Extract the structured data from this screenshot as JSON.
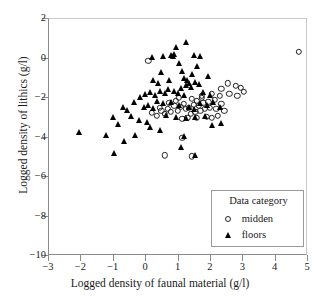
{
  "chart_data": {
    "type": "scatter",
    "title": "",
    "xlabel": "Logged density of faunal material (g/l)",
    "ylabel": "Logged density of lithics (g/l)",
    "xlim": [
      -3,
      5
    ],
    "ylim": [
      -10,
      2
    ],
    "xticks": [
      -3,
      -2,
      -1,
      0,
      1,
      2,
      3,
      4,
      5
    ],
    "yticks": [
      2,
      0,
      -2,
      -4,
      -6,
      -8,
      -10
    ],
    "xticklabels": [
      "−3",
      "−2",
      "−1",
      "0",
      "1",
      "2",
      "3",
      "4",
      "5"
    ],
    "yticklabels": [
      "2",
      "0",
      "−2",
      "−4",
      "−6",
      "−8",
      "−10"
    ],
    "grid": false,
    "legend_position": "lower right",
    "legend_title": "Data category",
    "series": [
      {
        "name": "midden",
        "marker": "open-circle",
        "color": "#222222",
        "points": [
          [
            4.75,
            0.3
          ],
          [
            2.55,
            -1.3
          ],
          [
            2.8,
            -1.45
          ],
          [
            2.95,
            -1.55
          ],
          [
            3.05,
            -1.75
          ],
          [
            2.35,
            -1.6
          ],
          [
            2.6,
            -1.85
          ],
          [
            2.85,
            -1.95
          ],
          [
            2.3,
            -1.95
          ],
          [
            2.05,
            -1.85
          ],
          [
            2.15,
            -2.15
          ],
          [
            1.95,
            -2.25
          ],
          [
            2.35,
            -2.35
          ],
          [
            1.75,
            -2.05
          ],
          [
            1.8,
            -2.3
          ],
          [
            1.6,
            -2.2
          ],
          [
            1.65,
            -2.45
          ],
          [
            1.45,
            -2.1
          ],
          [
            1.5,
            -2.4
          ],
          [
            1.35,
            -2.55
          ],
          [
            1.2,
            -2.35
          ],
          [
            1.25,
            -2.6
          ],
          [
            1.1,
            -2.5
          ],
          [
            1.0,
            -2.7
          ],
          [
            0.9,
            -2.45
          ],
          [
            0.8,
            -2.75
          ],
          [
            0.7,
            -2.6
          ],
          [
            0.6,
            -2.85
          ],
          [
            0.5,
            -2.7
          ],
          [
            0.35,
            -2.95
          ],
          [
            0.2,
            -2.8
          ],
          [
            1.4,
            -2.85
          ],
          [
            1.55,
            -2.75
          ],
          [
            1.7,
            -2.7
          ],
          [
            1.85,
            -2.6
          ],
          [
            2.0,
            -2.55
          ],
          [
            2.2,
            -2.6
          ],
          [
            2.45,
            -2.7
          ],
          [
            1.3,
            -3.05
          ],
          [
            1.15,
            -3.1
          ],
          [
            1.6,
            -3.05
          ],
          [
            1.9,
            -3.0
          ],
          [
            0.95,
            -2.2
          ],
          [
            1.05,
            -2.05
          ],
          [
            0.75,
            -2.3
          ],
          [
            0.1,
            -0.15
          ],
          [
            1.15,
            -4.05
          ],
          [
            1.45,
            -5.0
          ],
          [
            0.6,
            -4.95
          ],
          [
            2.05,
            -3.05
          ],
          [
            2.25,
            -2.95
          ],
          [
            0.45,
            -2.55
          ],
          [
            1.75,
            -1.95
          ]
        ]
      },
      {
        "name": "floors",
        "marker": "filled-triangle",
        "color": "#000000",
        "points": [
          [
            1.25,
            0.75
          ],
          [
            0.95,
            0.5
          ],
          [
            0.55,
            0.05
          ],
          [
            0.8,
            0.1
          ],
          [
            0.85,
            0.05
          ],
          [
            0.9,
            0.15
          ],
          [
            1.5,
            0.1
          ],
          [
            1.7,
            0.05
          ],
          [
            0.2,
            0.0
          ],
          [
            1.05,
            -0.3
          ],
          [
            1.6,
            -0.45
          ],
          [
            1.15,
            -0.7
          ],
          [
            1.45,
            -0.85
          ],
          [
            1.2,
            -1.05
          ],
          [
            1.3,
            -1.15
          ],
          [
            1.35,
            -1.3
          ],
          [
            1.25,
            -1.4
          ],
          [
            1.4,
            -1.5
          ],
          [
            1.1,
            -1.55
          ],
          [
            1.55,
            -1.25
          ],
          [
            1.65,
            -1.35
          ],
          [
            0.9,
            -1.7
          ],
          [
            1.0,
            -1.85
          ],
          [
            1.2,
            -1.95
          ],
          [
            0.7,
            -1.6
          ],
          [
            0.6,
            -1.85
          ],
          [
            0.45,
            -1.7
          ],
          [
            0.3,
            -1.95
          ],
          [
            0.15,
            -1.75
          ],
          [
            0.0,
            -1.9
          ],
          [
            -0.15,
            -2.05
          ],
          [
            0.35,
            -2.25
          ],
          [
            0.55,
            -2.35
          ],
          [
            0.1,
            -2.45
          ],
          [
            -0.05,
            -2.55
          ],
          [
            0.25,
            -2.6
          ],
          [
            0.8,
            -2.3
          ],
          [
            1.05,
            -2.45
          ],
          [
            1.35,
            -2.55
          ],
          [
            1.5,
            -2.65
          ],
          [
            1.7,
            -2.35
          ],
          [
            1.9,
            -2.45
          ],
          [
            2.1,
            -2.3
          ],
          [
            2.3,
            -2.55
          ],
          [
            0.65,
            -2.95
          ],
          [
            0.95,
            -3.05
          ],
          [
            1.25,
            -3.1
          ],
          [
            1.55,
            -3.05
          ],
          [
            1.85,
            -3.0
          ],
          [
            -0.35,
            -2.3
          ],
          [
            -0.55,
            -2.7
          ],
          [
            -0.7,
            -2.55
          ],
          [
            -0.45,
            -3.0
          ],
          [
            -0.2,
            -3.2
          ],
          [
            0.05,
            -3.3
          ],
          [
            -1.0,
            -3.05
          ],
          [
            -0.85,
            -3.4
          ],
          [
            2.35,
            -3.35
          ],
          [
            2.05,
            -3.45
          ],
          [
            -0.3,
            -3.95
          ],
          [
            -2.05,
            -3.8
          ],
          [
            -1.2,
            -3.95
          ],
          [
            -0.65,
            -4.25
          ],
          [
            0.15,
            -3.55
          ],
          [
            0.45,
            -3.7
          ],
          [
            1.2,
            -4.0
          ],
          [
            1.55,
            -4.95
          ],
          [
            -0.95,
            -4.85
          ],
          [
            1.1,
            -4.55
          ],
          [
            0.75,
            -1.15
          ],
          [
            0.4,
            -1.3
          ],
          [
            1.8,
            -1.75
          ],
          [
            2.0,
            -1.95
          ],
          [
            1.95,
            -0.95
          ],
          [
            0.5,
            -0.75
          ],
          [
            0.25,
            -1.15
          ]
        ]
      }
    ]
  }
}
